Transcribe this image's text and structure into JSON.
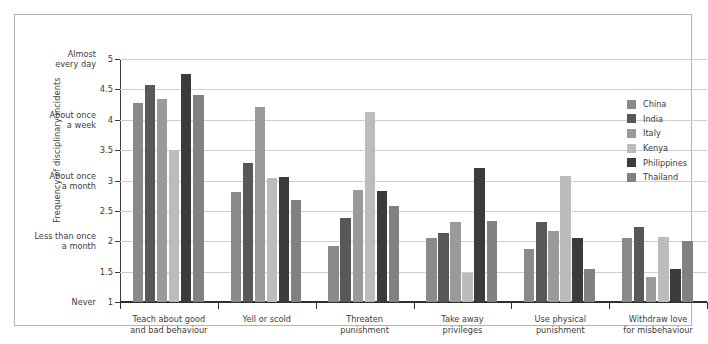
{
  "chart_data": {
    "type": "bar",
    "title": "",
    "xlabel": "",
    "ylabel": "Frequency of disciplinary incidents",
    "ylim": [
      1,
      5
    ],
    "grid": true,
    "legend_position": "right",
    "categories": [
      "Teach about good and bad behaviour",
      "Yell or scold",
      "Threaten punishment",
      "Take away privileges",
      "Use physical punishment",
      "Withdraw love for misbehaviour"
    ],
    "category_lines": [
      [
        "Teach about good",
        "and bad behaviour"
      ],
      [
        "Yell or scold",
        ""
      ],
      [
        "Threaten",
        "punishment"
      ],
      [
        "Take away",
        "privileges"
      ],
      [
        "Use physical",
        "punishment"
      ],
      [
        "Withdraw love",
        "for misbehaviour"
      ]
    ],
    "y_ticks": [
      1,
      1.5,
      2,
      2.5,
      3,
      3.5,
      4,
      4.5,
      5
    ],
    "y_tick_labels": [
      "1",
      "1.5",
      "2",
      "2.5",
      "3",
      "3.5",
      "4",
      "4.5",
      "5"
    ],
    "y_value_labels": [
      {
        "value": 5,
        "lines": [
          "Almost",
          "every day"
        ]
      },
      {
        "value": 4,
        "lines": [
          "About once",
          "a week"
        ]
      },
      {
        "value": 3,
        "lines": [
          "About once",
          "a month"
        ]
      },
      {
        "value": 2,
        "lines": [
          "Less than once",
          "a month"
        ]
      },
      {
        "value": 1,
        "lines": [
          "Never",
          ""
        ]
      }
    ],
    "series": [
      {
        "name": "China",
        "color": "#8a8a8a",
        "values": [
          4.27,
          2.81,
          1.93,
          2.05,
          1.88,
          2.05
        ]
      },
      {
        "name": "India",
        "color": "#585859",
        "values": [
          4.58,
          3.29,
          2.38,
          2.13,
          2.31,
          2.23
        ]
      },
      {
        "name": "Italy",
        "color": "#9a9a9a",
        "values": [
          4.34,
          4.21,
          2.85,
          2.32,
          2.17,
          1.42
        ]
      },
      {
        "name": "Kenya",
        "color": "#bcbcbc",
        "values": [
          3.51,
          3.04,
          4.12,
          1.48,
          3.07,
          2.07
        ]
      },
      {
        "name": "Philippines",
        "color": "#3b3b3d",
        "values": [
          4.75,
          3.05,
          2.82,
          3.2,
          2.05,
          1.54
        ]
      },
      {
        "name": "Thailand",
        "color": "#818183",
        "values": [
          4.41,
          2.68,
          2.58,
          2.33,
          1.55,
          2.0
        ]
      }
    ]
  }
}
